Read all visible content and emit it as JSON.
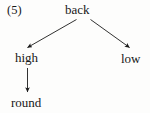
{
  "figure": {
    "example_number": "(5)",
    "type": "tree-diagram",
    "background_color": "#fdfdfc",
    "line_color": "#1b1b1b",
    "text_color": "#181818"
  },
  "nodes": {
    "root": {
      "id": "back",
      "label": "back"
    },
    "left_child": {
      "id": "high",
      "label": "high"
    },
    "right_child": {
      "id": "low",
      "label": "low"
    },
    "grandchild": {
      "id": "round",
      "label": "round"
    }
  },
  "edges": [
    {
      "from": "back",
      "to": "high",
      "direction": "down-left",
      "arrowhead": true
    },
    {
      "from": "back",
      "to": "low",
      "direction": "down-right",
      "arrowhead": true
    },
    {
      "from": "high",
      "to": "round",
      "direction": "down",
      "arrowhead": true
    }
  ]
}
